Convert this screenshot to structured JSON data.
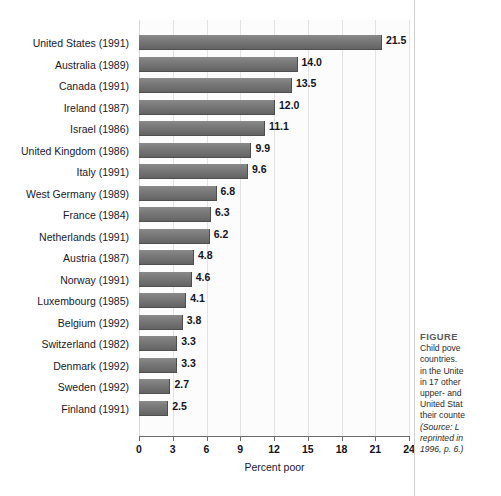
{
  "chart_data": {
    "type": "bar",
    "orientation": "horizontal",
    "title": "",
    "xlabel": "Percent poor",
    "ylabel": "",
    "xlim": [
      0,
      24
    ],
    "xticks": [
      "0",
      "3",
      "6",
      "9",
      "12",
      "15",
      "18",
      "21",
      "24"
    ],
    "grid": true,
    "legend": "none",
    "bar_color": "#707070",
    "categories": [
      "United States (1991)",
      "Australia (1989)",
      "Canada (1991)",
      "Ireland (1987)",
      "Israel (1986)",
      "United Kingdom (1986)",
      "Italy (1991)",
      "West Germany (1989)",
      "France (1984)",
      "Netherlands (1991)",
      "Austria (1987)",
      "Norway (1991)",
      "Luxembourg (1985)",
      "Belgium (1992)",
      "Switzerland (1982)",
      "Denmark (1992)",
      "Sweden (1992)",
      "Finland (1991)"
    ],
    "values": [
      21.5,
      14.0,
      13.5,
      12.0,
      11.1,
      9.9,
      9.6,
      6.8,
      6.3,
      6.2,
      4.8,
      4.6,
      4.1,
      3.8,
      3.3,
      3.3,
      2.7,
      2.5
    ],
    "value_labels": [
      "21.5",
      "14.0",
      "13.5",
      "12.0",
      "11.1",
      "9.9",
      "9.6",
      "6.8",
      "6.3",
      "6.2",
      "4.8",
      "4.6",
      "4.1",
      "3.8",
      "3.3",
      "3.3",
      "2.7",
      "2.5"
    ]
  },
  "caption": {
    "heading": "FIGURE",
    "lines": [
      "Child pove",
      "countries. ",
      "in the Unite",
      "in 17 other",
      "upper- and",
      "United Stat",
      "their counte"
    ],
    "source_lines": [
      "(Source: L",
      "reprinted in",
      "1996, p. 6.)"
    ]
  }
}
